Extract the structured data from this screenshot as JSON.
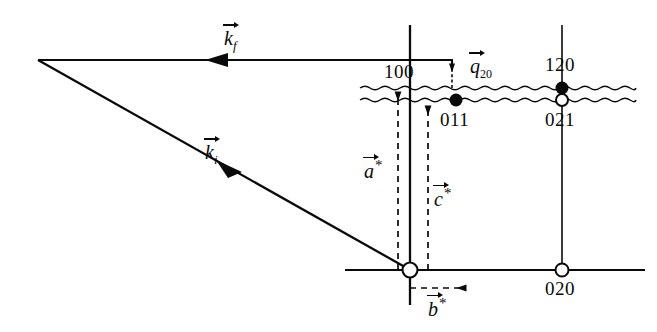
{
  "figure": {
    "type": "reciprocal-space-scattering-diagram",
    "background_color": "#ffffff",
    "ink_color": "#0a0a0a",
    "width": 657,
    "height": 332
  },
  "vectors": {
    "k_final": {
      "symbol": "k",
      "subscript": "f",
      "label": "k_f",
      "direction": "left",
      "description": "outgoing wavevector, horizontal arrow pointing left"
    },
    "k_initial": {
      "symbol": "k",
      "subscript": "i",
      "label": "k_i",
      "direction": "up-left",
      "description": "incoming wavevector, diagonal arrow pointing up-left"
    },
    "q_scattering": {
      "symbol": "q",
      "subscript": "20",
      "label": "q_20",
      "direction": "up",
      "description": "scattering vector, short vertical arrow pointing up"
    },
    "a_star": {
      "symbol": "a",
      "superscript": "*",
      "label": "a*",
      "direction": "up",
      "style": "dashed"
    },
    "b_star": {
      "symbol": "b",
      "superscript": "*",
      "label": "b*",
      "direction": "right",
      "style": "dashed"
    },
    "c_star": {
      "symbol": "c",
      "superscript": "*",
      "label": "c*",
      "direction": "up",
      "style": "dashed"
    }
  },
  "reflections": [
    {
      "index": "100",
      "marker": "none",
      "label_x": 385,
      "label_y": 62,
      "note": "label above wavy lines on the a* column"
    },
    {
      "index": "011",
      "marker": "filled",
      "label_x": 441,
      "label_y": 110,
      "dot_x": 456,
      "dot_y": 100
    },
    {
      "index": "120",
      "marker": "filled",
      "label_x": 546,
      "label_y": 56,
      "dot_x": 562,
      "dot_y": 88
    },
    {
      "index": "021",
      "marker": "open",
      "label_x": 546,
      "label_y": 110,
      "dot_x": 562,
      "dot_y": 100
    },
    {
      "index": "020",
      "marker": "open",
      "label_x": 546,
      "label_y": 279,
      "dot_x": 562,
      "dot_y": 270
    },
    {
      "index": "000",
      "marker": "open-origin",
      "dot_x": 410,
      "dot_y": 270,
      "note": "unlabeled origin circle"
    }
  ],
  "diffuse_lines": {
    "count": 2,
    "style": "wavy",
    "upper_y": 88,
    "lower_y": 100,
    "x_start": 360,
    "x_end": 636
  },
  "axes": {
    "horizontal_row_y": 270,
    "horizontal_x_start": 345,
    "horizontal_x_end": 645,
    "vertical_columns_x": [
      410,
      562
    ]
  },
  "legend_notes": {
    "filled_marker": "filled circle",
    "open_marker": "open circle"
  }
}
